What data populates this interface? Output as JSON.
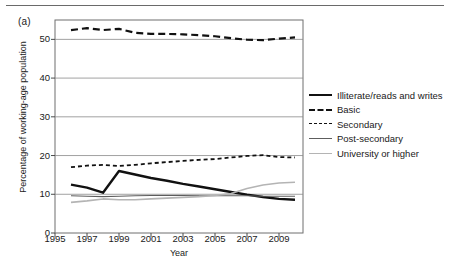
{
  "panel": {
    "label": "(a)"
  },
  "legend": {
    "position": "right",
    "entries": [
      {
        "label": "Illiterate/reads and writes",
        "style": "solid-thick",
        "color": "#111111",
        "key_name": "legend-key-illiterate"
      },
      {
        "label": "Basic",
        "style": "long-dash",
        "color": "#111111",
        "key_name": "legend-key-basic"
      },
      {
        "label": "Secondary",
        "style": "short-dash",
        "color": "#111111",
        "key_name": "legend-key-secondary"
      },
      {
        "label": "Post-secondary",
        "style": "solid-thin",
        "color": "#5d5d5d",
        "key_name": "legend-key-post-secondary"
      },
      {
        "label": "University or higher",
        "style": "solid-light",
        "color": "#b4b4b4",
        "key_name": "legend-key-university"
      }
    ]
  },
  "chart_data": {
    "type": "line",
    "title": "",
    "xlabel": "Year",
    "ylabel": "Percentage of working-age population",
    "xlim": [
      1995,
      2010.5
    ],
    "ylim": [
      0,
      55
    ],
    "yticks": [
      0,
      10,
      20,
      30,
      40,
      50
    ],
    "xticks": [
      1995,
      1997,
      1999,
      2001,
      2003,
      2005,
      2007,
      2009
    ],
    "grid": "horizontal",
    "x": [
      1996,
      1997,
      1998,
      1999,
      2000,
      2001,
      2002,
      2003,
      2004,
      2005,
      2006,
      2007,
      2008,
      2009,
      2010
    ],
    "series": [
      {
        "name": "Illiterate/reads and writes",
        "style": "solid-thick",
        "color": "#111111",
        "values": [
          12.5,
          11.7,
          10.4,
          16.0,
          15.1,
          14.2,
          13.5,
          12.7,
          12.0,
          11.3,
          10.6,
          9.9,
          9.3,
          8.8,
          8.6
        ]
      },
      {
        "name": "Basic",
        "style": "long-dash",
        "color": "#111111",
        "values": [
          52.4,
          52.9,
          52.4,
          52.7,
          51.7,
          51.4,
          51.4,
          51.3,
          51.1,
          50.8,
          50.3,
          49.9,
          49.8,
          50.2,
          50.5
        ]
      },
      {
        "name": "Secondary",
        "style": "short-dash",
        "color": "#111111",
        "values": [
          17.0,
          17.4,
          17.6,
          17.3,
          17.6,
          18.0,
          18.3,
          18.6,
          18.9,
          19.1,
          19.5,
          19.9,
          20.1,
          19.6,
          19.5
        ]
      },
      {
        "name": "Post-secondary",
        "style": "solid-thin",
        "color": "#5d5d5d",
        "values": [
          9.6,
          9.5,
          9.4,
          9.5,
          9.6,
          9.7,
          9.7,
          9.7,
          9.6,
          9.6,
          9.6,
          9.6,
          9.5,
          9.5,
          9.5
        ]
      },
      {
        "name": "University or higher",
        "style": "solid-light",
        "color": "#b4b4b4",
        "values": [
          7.9,
          8.3,
          8.8,
          8.6,
          8.6,
          8.8,
          9.0,
          9.2,
          9.4,
          9.7,
          10.2,
          11.5,
          12.4,
          12.9,
          13.1
        ]
      }
    ]
  }
}
